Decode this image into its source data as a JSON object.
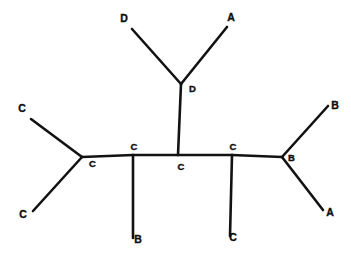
{
  "figure": {
    "name": "unrooted-phylogenetic-tree",
    "background_color": "#ffffff",
    "line_color": "#121212",
    "label_color": "#0d0d0d"
  },
  "tips": [
    {
      "id": "tip-d-top-left",
      "label": "D",
      "x": 124,
      "y": 22,
      "anchor": "middle"
    },
    {
      "id": "tip-a-top-right",
      "label": "A",
      "x": 231,
      "y": 21,
      "anchor": "middle"
    },
    {
      "id": "tip-c-upper-left",
      "label": "C",
      "x": 22,
      "y": 112,
      "anchor": "middle"
    },
    {
      "id": "tip-c-lower-left",
      "label": "C",
      "x": 23,
      "y": 218,
      "anchor": "middle"
    },
    {
      "id": "tip-b-bottom",
      "label": "B",
      "x": 138,
      "y": 243,
      "anchor": "middle"
    },
    {
      "id": "tip-c-bottom",
      "label": "C",
      "x": 233,
      "y": 241,
      "anchor": "middle"
    },
    {
      "id": "tip-b-upper-right",
      "label": "B",
      "x": 335,
      "y": 109,
      "anchor": "middle"
    },
    {
      "id": "tip-a-lower-right",
      "label": "A",
      "x": 330,
      "y": 216,
      "anchor": "middle"
    }
  ],
  "internal_nodes": [
    {
      "id": "node-d-junction",
      "label": "D",
      "x": 189,
      "y": 92,
      "anchor": "start"
    },
    {
      "id": "node-c-left",
      "label": "C",
      "x": 89,
      "y": 167,
      "anchor": "start"
    },
    {
      "id": "node-c-second",
      "label": "C",
      "x": 134,
      "y": 150,
      "anchor": "middle"
    },
    {
      "id": "node-c-center",
      "label": "C",
      "x": 181,
      "y": 170,
      "anchor": "middle"
    },
    {
      "id": "node-c-fourth",
      "label": "C",
      "x": 233,
      "y": 150,
      "anchor": "middle"
    },
    {
      "id": "node-b-right",
      "label": "B",
      "x": 288,
      "y": 161,
      "anchor": "start"
    }
  ],
  "edges": [
    {
      "id": "edge-backbone-c-left-to-c-second",
      "from": "node-c-left",
      "to": "node-c-second",
      "x1": 82,
      "y1": 157,
      "x2": 133,
      "y2": 155
    },
    {
      "id": "edge-backbone-c-second-to-c-center",
      "from": "node-c-second",
      "to": "node-c-center",
      "x1": 133,
      "y1": 155,
      "x2": 178,
      "y2": 155
    },
    {
      "id": "edge-backbone-c-center-to-c-fourth",
      "from": "node-c-center",
      "to": "node-c-fourth",
      "x1": 178,
      "y1": 155,
      "x2": 232,
      "y2": 155
    },
    {
      "id": "edge-backbone-c-fourth-to-b-right",
      "from": "node-c-fourth",
      "to": "node-b-right",
      "x1": 232,
      "y1": 155,
      "x2": 282,
      "y2": 157
    },
    {
      "id": "edge-c-left-to-tip-c-upper-left",
      "from": "node-c-left",
      "to": "tip-c-upper-left",
      "x1": 82,
      "y1": 157,
      "x2": 31,
      "y2": 119
    },
    {
      "id": "edge-c-left-to-tip-c-lower-left",
      "from": "node-c-left",
      "to": "tip-c-lower-left",
      "x1": 82,
      "y1": 157,
      "x2": 33,
      "y2": 211
    },
    {
      "id": "edge-c-second-to-tip-b-bottom",
      "from": "node-c-second",
      "to": "tip-b-bottom",
      "x1": 133,
      "y1": 155,
      "x2": 133,
      "y2": 238
    },
    {
      "id": "edge-c-center-to-node-d-junction",
      "from": "node-c-center",
      "to": "node-d-junction",
      "x1": 178,
      "y1": 155,
      "x2": 181,
      "y2": 84
    },
    {
      "id": "edge-d-junction-to-tip-d-top-left",
      "from": "node-d-junction",
      "to": "tip-d-top-left",
      "x1": 181,
      "y1": 84,
      "x2": 132,
      "y2": 29
    },
    {
      "id": "edge-d-junction-to-tip-a-top-right",
      "from": "node-d-junction",
      "to": "tip-a-top-right",
      "x1": 181,
      "y1": 84,
      "x2": 227,
      "y2": 27
    },
    {
      "id": "edge-c-fourth-to-tip-c-bottom",
      "from": "node-c-fourth",
      "to": "tip-c-bottom",
      "x1": 232,
      "y1": 155,
      "x2": 230,
      "y2": 236
    },
    {
      "id": "edge-b-right-to-tip-b-upper-right",
      "from": "node-b-right",
      "to": "tip-b-upper-right",
      "x1": 282,
      "y1": 157,
      "x2": 328,
      "y2": 106
    },
    {
      "id": "edge-b-right-to-tip-a-lower-right",
      "from": "node-b-right",
      "to": "tip-a-lower-right",
      "x1": 282,
      "y1": 157,
      "x2": 323,
      "y2": 210
    }
  ]
}
